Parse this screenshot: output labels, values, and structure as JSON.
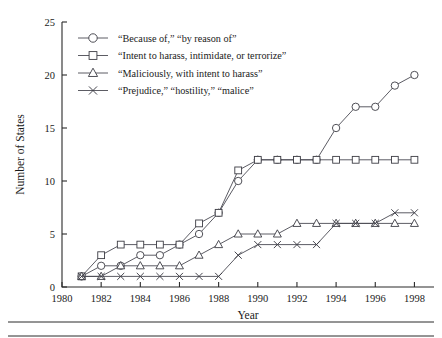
{
  "chart_data": {
    "type": "line",
    "title": "",
    "xlabel": "Year",
    "ylabel": "Number of States",
    "xlim": [
      1980,
      1999
    ],
    "ylim": [
      0,
      25
    ],
    "xticks": [
      1980,
      1982,
      1984,
      1986,
      1988,
      1990,
      1992,
      1994,
      1996,
      1998
    ],
    "yticks": [
      0,
      5,
      10,
      15,
      20,
      25
    ],
    "grid": false,
    "legend_position": "top-left",
    "x": [
      1981,
      1982,
      1983,
      1984,
      1985,
      1986,
      1987,
      1988,
      1989,
      1990,
      1991,
      1992,
      1993,
      1994,
      1995,
      1996,
      1997,
      1998
    ],
    "series": [
      {
        "name": "“Because of,” “by reason of”",
        "marker": "circle",
        "values": [
          1,
          2,
          2,
          3,
          3,
          4,
          5,
          7,
          10,
          12,
          12,
          12,
          12,
          15,
          17,
          17,
          19,
          20
        ]
      },
      {
        "name": "“Intent to harass, intimidate, or terrorize”",
        "marker": "square",
        "values": [
          1,
          3,
          4,
          4,
          4,
          4,
          6,
          7,
          11,
          12,
          12,
          12,
          12,
          12,
          12,
          12,
          12,
          12
        ]
      },
      {
        "name": "“Maliciously, with intent to harass”",
        "marker": "triangle",
        "values": [
          1,
          1,
          2,
          2,
          2,
          2,
          3,
          4,
          5,
          5,
          5,
          6,
          6,
          6,
          6,
          6,
          6,
          6
        ]
      },
      {
        "name": "“Prejudice,” “hostility,” “malice”",
        "marker": "cross",
        "values": [
          1,
          1,
          1,
          1,
          1,
          1,
          1,
          1,
          3,
          4,
          4,
          4,
          4,
          6,
          6,
          6,
          7,
          7
        ]
      }
    ]
  },
  "colors": {
    "line": "#4a4a52",
    "marker_stroke": "#3c3c44",
    "marker_fill": "#ffffff",
    "axis": "#2a2a2a",
    "background": "#ffffff"
  }
}
